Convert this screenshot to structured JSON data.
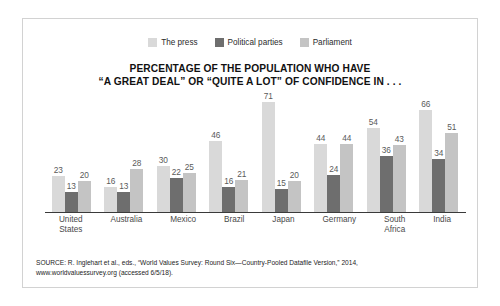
{
  "chart_data": {
    "type": "bar",
    "title": "PERCENTAGE OF THE POPULATION WHO HAVE “A GREAT DEAL” OR “QUITE A LOT” OF CONFIDENCE IN . . .",
    "title_lines": [
      "PERCENTAGE OF THE POPULATION WHO HAVE",
      "“A GREAT DEAL” OR “QUITE A LOT” OF CONFIDENCE IN . . ."
    ],
    "xlabel": "",
    "ylabel": "",
    "ylim": [
      0,
      75
    ],
    "grid": false,
    "legend_position": "top-center",
    "categories": [
      "United States",
      "Australia",
      "Mexico",
      "Brazil",
      "Japan",
      "Germany",
      "South Africa",
      "India"
    ],
    "category_lines": [
      [
        "United",
        "States"
      ],
      [
        "Australia"
      ],
      [
        "Mexico"
      ],
      [
        "Brazil"
      ],
      [
        "Japan"
      ],
      [
        "Germany"
      ],
      [
        "South",
        "Africa"
      ],
      [
        "India"
      ]
    ],
    "series": [
      {
        "name": "The press",
        "color": "#d9d9d9",
        "values": [
          23,
          16,
          30,
          46,
          71,
          44,
          54,
          66
        ]
      },
      {
        "name": "Political parties",
        "color": "#6e6e6e",
        "values": [
          13,
          13,
          22,
          16,
          15,
          24,
          36,
          34
        ]
      },
      {
        "name": "Parliament",
        "color": "#c4c4c4",
        "values": [
          20,
          28,
          25,
          21,
          20,
          44,
          43,
          51
        ]
      }
    ],
    "source_lines": [
      "SOURCE: R. Inglehart et al., eds., “World Values Survey: Round Six—Country-Pooled Datafile Version,” 2014,",
      "www.worldvaluessurvey.org (accessed 6/5/18)."
    ]
  },
  "colors": {
    "frame_border": "#d2d2d2",
    "axis": "#3a3a3a",
    "title_text": "#111111",
    "value_text": "#5a5a5a",
    "category_text": "#4a4a4a",
    "source_text": "#1d1d1d",
    "background": "#ffffff"
  }
}
